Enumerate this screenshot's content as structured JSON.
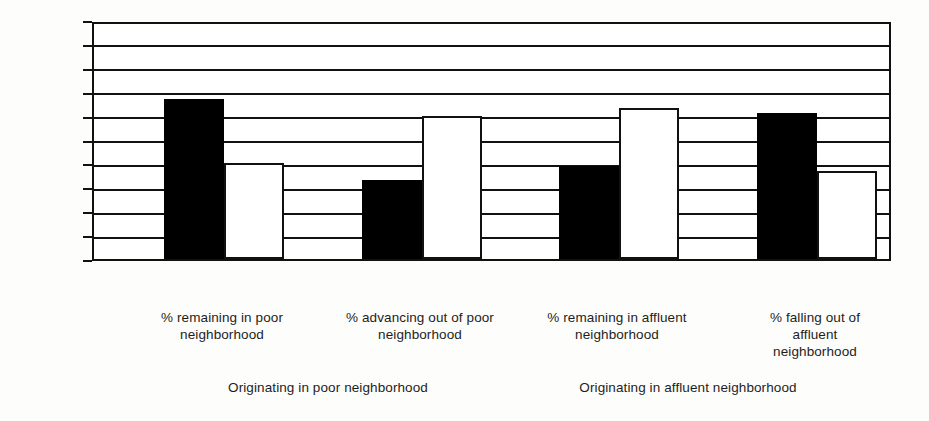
{
  "chart_data": {
    "type": "bar",
    "title": "",
    "xlabel": "",
    "ylabel": "",
    "ylim": [
      0,
      100
    ],
    "grid": true,
    "legend_position": "none",
    "categories": [
      "% remaining in poor neighborhood",
      "% advancing out of poor neighborhood",
      "% remaining in affluent neighborhood",
      "% falling out of affluent neighborhood"
    ],
    "series": [
      {
        "name": "Black",
        "values": [
          67,
          33,
          39,
          61
        ]
      },
      {
        "name": "White",
        "values": [
          40,
          60,
          63,
          37
        ]
      }
    ],
    "group_labels": [
      "Originating in poor neighborhood",
      "Originating in affluent neighborhood"
    ],
    "y_ticks": [
      "0%",
      "10%",
      "20%",
      "30%",
      "40%",
      "50%",
      "60%",
      "70%",
      "80%",
      "90%",
      "100%"
    ],
    "data_labels": [
      "67%",
      "40%",
      "33%",
      "60%",
      "39%",
      "63%",
      "61%",
      "37%"
    ]
  },
  "axis": {
    "y_ticks": [
      {
        "label": "100%",
        "value": 100
      },
      {
        "label": "90%",
        "value": 90
      },
      {
        "label": "80%",
        "value": 80
      },
      {
        "label": "70%",
        "value": 70
      },
      {
        "label": "60%",
        "value": 60
      },
      {
        "label": "50%",
        "value": 50
      },
      {
        "label": "40%",
        "value": 40
      },
      {
        "label": "30%",
        "value": 30
      },
      {
        "label": "20%",
        "value": 20
      },
      {
        "label": "10%",
        "value": 10
      },
      {
        "label": "0%",
        "value": 0
      }
    ]
  },
  "groups": [
    {
      "caption_lines": [
        "% remaining in poor",
        "neighborhood"
      ],
      "bars": [
        {
          "series": "Black",
          "label": "67%",
          "value": 67,
          "color": "#000000"
        },
        {
          "series": "White",
          "label": "40%",
          "value": 40,
          "color": "#ffffff"
        }
      ]
    },
    {
      "caption_lines": [
        "% advancing out of poor",
        "neighborhood"
      ],
      "bars": [
        {
          "series": "Black",
          "label": "33%",
          "value": 33,
          "color": "#000000"
        },
        {
          "series": "White",
          "label": "60%",
          "value": 60,
          "color": "#ffffff"
        }
      ]
    },
    {
      "caption_lines": [
        "% remaining in affluent",
        "neighborhood"
      ],
      "bars": [
        {
          "series": "Black",
          "label": "39%",
          "value": 39,
          "color": "#000000"
        },
        {
          "series": "White",
          "label": "63%",
          "value": 63,
          "color": "#ffffff"
        }
      ]
    },
    {
      "caption_lines": [
        "% falling out of",
        "affluent",
        "neighborhood"
      ],
      "bars": [
        {
          "series": "Black",
          "label": "61%",
          "value": 61,
          "color": "#000000"
        },
        {
          "series": "White",
          "label": "37%",
          "value": 37,
          "color": "#ffffff"
        }
      ]
    }
  ],
  "series_tick_labels": [
    "Black",
    "White"
  ],
  "origin_captions": [
    "Originating in poor neighborhood",
    "Originating in affluent neighborhood"
  ],
  "colors": {
    "black_series": "#000000",
    "white_series": "#ffffff",
    "axis": "#111111",
    "text": "#1d1d1d",
    "background": "#fdfdfb"
  }
}
